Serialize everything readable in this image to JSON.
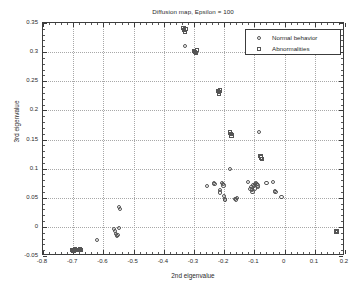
{
  "chart_data": {
    "type": "scatter",
    "title": "Diffusion map, Epsilon = 100",
    "xlabel": "2nd eigenvalue",
    "ylabel": "3rd eigenvalue",
    "xlim": [
      -0.8,
      0.2
    ],
    "ylim": [
      -0.05,
      0.35
    ],
    "xticks": [
      "-0.8",
      "-0.7",
      "-0.6",
      "-0.5",
      "-0.4",
      "-0.3",
      "-0.2",
      "-0.1",
      "0",
      "0.1",
      "0.2"
    ],
    "xtick_values": [
      -0.8,
      -0.7,
      -0.6,
      -0.5,
      -0.4,
      -0.3,
      -0.2,
      -0.1,
      0,
      0.1,
      0.2
    ],
    "yticks": [
      "-0.05",
      "0",
      "0.05",
      "0.1",
      "0.15",
      "0.2",
      "0.25",
      "0.3",
      "0.35"
    ],
    "ytick_values": [
      -0.05,
      0,
      0.05,
      0.1,
      0.15,
      0.2,
      0.25,
      0.3,
      0.35
    ],
    "grid": true,
    "legend_position": "upper right",
    "marker_color": "#555555",
    "grid_color": "#a8a8a8",
    "axis_color": "#3c3c3c",
    "series": [
      {
        "name": "Normal behavior",
        "marker": "circle",
        "points": [
          [
            -0.621,
            -0.023
          ],
          [
            -0.566,
            -0.004
          ],
          [
            -0.562,
            -0.007
          ],
          [
            -0.558,
            -0.012
          ],
          [
            -0.556,
            -0.016
          ],
          [
            -0.553,
            -0.014
          ],
          [
            -0.549,
            -0.002
          ],
          [
            -0.547,
            0.034
          ],
          [
            -0.546,
            0.031
          ],
          [
            -0.33,
            0.31
          ],
          [
            -0.256,
            0.07
          ],
          [
            -0.234,
            0.075
          ],
          [
            -0.232,
            0.073
          ],
          [
            -0.215,
            0.063
          ],
          [
            -0.214,
            0.059
          ],
          [
            -0.206,
            0.075
          ],
          [
            -0.204,
            0.073
          ],
          [
            -0.202,
            0.071
          ],
          [
            -0.2,
            0.053
          ],
          [
            -0.198,
            0.047
          ],
          [
            -0.196,
            0.046
          ],
          [
            -0.18,
            0.099
          ],
          [
            -0.163,
            0.048
          ],
          [
            -0.16,
            0.047
          ],
          [
            -0.157,
            0.05
          ],
          [
            -0.122,
            0.077
          ],
          [
            -0.113,
            0.065
          ],
          [
            -0.11,
            0.068
          ],
          [
            -0.108,
            0.063
          ],
          [
            -0.106,
            0.06
          ],
          [
            -0.104,
            0.072
          ],
          [
            -0.101,
            0.07
          ],
          [
            -0.099,
            0.066
          ],
          [
            -0.097,
            0.073
          ],
          [
            -0.095,
            0.075
          ],
          [
            -0.092,
            0.074
          ],
          [
            -0.09,
            0.071
          ],
          [
            -0.088,
            0.068
          ],
          [
            -0.085,
            0.163
          ],
          [
            -0.06,
            0.075
          ],
          [
            -0.038,
            0.077
          ],
          [
            -0.032,
            0.062
          ],
          [
            -0.03,
            0.06
          ],
          [
            -0.01,
            0.051
          ]
        ]
      },
      {
        "name": "Abnormalities",
        "marker": "square",
        "points": [
          [
            -0.703,
            -0.04
          ],
          [
            -0.7,
            -0.042
          ],
          [
            -0.697,
            -0.041
          ],
          [
            -0.693,
            -0.039
          ],
          [
            -0.69,
            -0.04
          ],
          [
            -0.682,
            -0.04
          ],
          [
            -0.677,
            -0.039
          ],
          [
            -0.673,
            -0.04
          ],
          [
            -0.335,
            0.341
          ],
          [
            -0.332,
            0.338
          ],
          [
            -0.33,
            0.335
          ],
          [
            -0.328,
            0.34
          ],
          [
            -0.299,
            0.302
          ],
          [
            -0.296,
            0.3
          ],
          [
            -0.293,
            0.299
          ],
          [
            -0.291,
            0.303
          ],
          [
            -0.22,
            0.233
          ],
          [
            -0.218,
            0.231
          ],
          [
            -0.216,
            0.229
          ],
          [
            -0.214,
            0.234
          ],
          [
            -0.18,
            0.162
          ],
          [
            -0.178,
            0.159
          ],
          [
            -0.176,
            0.157
          ],
          [
            -0.08,
            0.122
          ],
          [
            -0.078,
            0.119
          ],
          [
            -0.076,
            0.117
          ],
          [
            0.17,
            -0.008
          ],
          [
            0.172,
            -0.009
          ],
          [
            0.174,
            -0.007
          ]
        ]
      }
    ]
  },
  "legend": {
    "entries": [
      {
        "label": "Normal behavior",
        "marker": "circle"
      },
      {
        "label": "Abnormalities",
        "marker": "square"
      }
    ]
  }
}
